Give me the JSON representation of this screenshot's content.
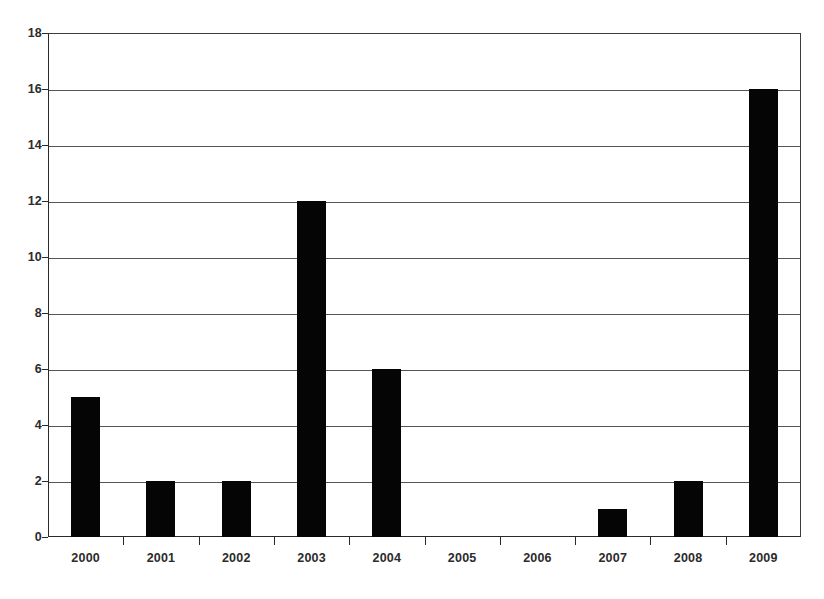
{
  "chart_data": {
    "type": "bar",
    "title": "",
    "subtitle": "",
    "xlabel": "",
    "ylabel": "",
    "categories": [
      "2000",
      "2001",
      "2002",
      "2003",
      "2004",
      "2005",
      "2006",
      "2007",
      "2008",
      "2009"
    ],
    "values": [
      5,
      2,
      2,
      12,
      6,
      0,
      0,
      1,
      2,
      16
    ],
    "ylim": [
      0,
      18
    ],
    "y_ticks": [
      0,
      2,
      4,
      6,
      8,
      10,
      12,
      14,
      16,
      18
    ],
    "y_tick_labels": [
      "0",
      "2",
      "4",
      "6",
      "8",
      "10",
      "12",
      "14",
      "16",
      "18"
    ],
    "grid": {
      "horizontal": true,
      "vertical": false
    },
    "legend": {
      "visible": false,
      "position": "none",
      "entries": []
    },
    "annotations": [],
    "colors": {
      "bar": "#050505",
      "gridline": "#555555",
      "axis": "#2a2a2a",
      "text": "#2b2b2b",
      "background": "#ffffff"
    }
  }
}
